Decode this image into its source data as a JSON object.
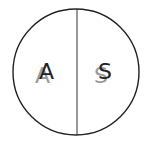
{
  "diagram": {
    "circle": {
      "cx": 76,
      "cy": 72,
      "r": 63,
      "stroke": "#222222",
      "stroke_width": 1.4,
      "fill": "#ffffff"
    },
    "divider": {
      "x": 77,
      "y1": 9,
      "y2": 135,
      "stroke": "#333333",
      "stroke_width": 1
    },
    "left_half": {
      "label": "A",
      "shadow_label": "A",
      "primary_color": "#222222",
      "shadow_color": "#9a9a9a"
    },
    "right_half": {
      "label": "S",
      "shadow_label": "S",
      "primary_color": "#222222",
      "shadow_color": "#9a9a9a"
    }
  }
}
